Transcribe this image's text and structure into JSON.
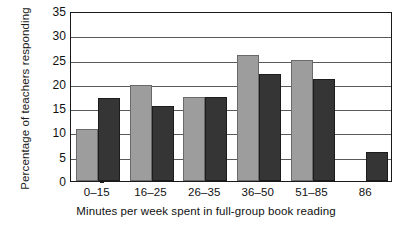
{
  "chart_data": {
    "type": "bar",
    "title": "",
    "subtitle": "",
    "xlabel": "Minutes per week spent in full-group book reading",
    "ylabel": "Percentage of teachers responding",
    "categories": [
      "0–15",
      "16–25",
      "26–35",
      "36–50",
      "51–85",
      "86"
    ],
    "series": [
      {
        "name": "light-series",
        "color": "#9d9d9d",
        "values": [
          10.7,
          19.7,
          17.3,
          26.0,
          25.0,
          0
        ]
      },
      {
        "name": "dark-series",
        "color": "#353535",
        "values": [
          17.0,
          15.5,
          17.3,
          22.0,
          21.0,
          6.0
        ]
      }
    ],
    "ylim": [
      0,
      35
    ],
    "yticks": [
      0,
      5,
      10,
      15,
      20,
      25,
      30,
      35
    ],
    "ytick_labels": [
      "0",
      "5",
      "10",
      "15",
      "20",
      "25",
      "30",
      "35"
    ],
    "grid": true,
    "grid_axis": "y",
    "legend": false,
    "legend_position": "none",
    "axis_color": "#1a1a1a",
    "grid_color": "#5a5a5a",
    "background": "#ffffff"
  }
}
